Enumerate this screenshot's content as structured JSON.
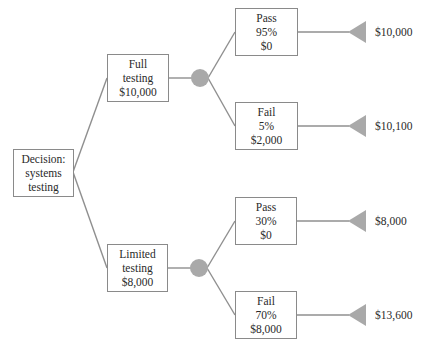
{
  "diagram": {
    "type": "decision-tree",
    "colors": {
      "line": "#8f8f8f",
      "chance_node": "#a9a9a9",
      "terminal": "#a9a9a9",
      "box_border": "#8a8a8a",
      "text": "#2a2a2a"
    },
    "root": {
      "lines": [
        "Decision:",
        "systems",
        "testing"
      ]
    },
    "alternatives": [
      {
        "lines": [
          "Full",
          "testing",
          "$10,000"
        ],
        "outcomes": [
          {
            "lines": [
              "Pass",
              "95%",
              "$0"
            ],
            "payoff": "$10,000"
          },
          {
            "lines": [
              "Fail",
              "5%",
              "$2,000"
            ],
            "payoff": "$10,100"
          }
        ]
      },
      {
        "lines": [
          "Limited",
          "testing",
          "$8,000"
        ],
        "outcomes": [
          {
            "lines": [
              "Pass",
              "30%",
              "$0"
            ],
            "payoff": "$8,000"
          },
          {
            "lines": [
              "Fail",
              "70%",
              "$8,000"
            ],
            "payoff": "$13,600"
          }
        ]
      }
    ]
  }
}
